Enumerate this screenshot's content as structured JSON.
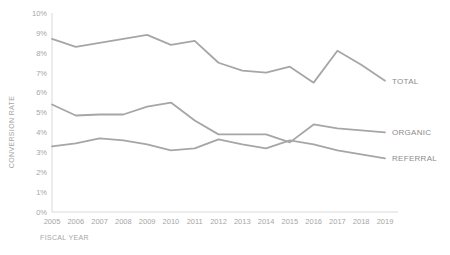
{
  "chart_data": {
    "type": "line",
    "title": "",
    "xlabel": "FISCAL YEAR",
    "ylabel": "CONVERSION RATE",
    "categories": [
      "2005",
      "2006",
      "2007",
      "2008",
      "2009",
      "2010",
      "2011",
      "2012",
      "2013",
      "2014",
      "2015",
      "2016",
      "2017",
      "2018",
      "2019"
    ],
    "x": [
      2005,
      2006,
      2007,
      2008,
      2009,
      2010,
      2011,
      2012,
      2013,
      2014,
      2015,
      2016,
      2017,
      2018,
      2019
    ],
    "ylim": [
      0,
      10
    ],
    "ytick_labels": [
      "0%",
      "1%",
      "2%",
      "3%",
      "4%",
      "5%",
      "6%",
      "7%",
      "8%",
      "9%",
      "10%"
    ],
    "ytick_values": [
      0,
      1,
      2,
      3,
      4,
      5,
      6,
      7,
      8,
      9,
      10
    ],
    "grid": false,
    "legend_position": "right-end-of-line",
    "series": [
      {
        "name": "TOTAL",
        "color": "#a6a6a6",
        "values": [
          8.7,
          8.3,
          8.5,
          8.7,
          8.9,
          8.4,
          8.6,
          7.5,
          7.1,
          7.0,
          7.3,
          6.5,
          8.1,
          7.4,
          6.6
        ]
      },
      {
        "name": "ORGANIC",
        "color": "#a6a6a6",
        "values": [
          5.4,
          4.85,
          4.9,
          4.9,
          5.3,
          5.5,
          4.6,
          3.9,
          3.9,
          3.9,
          3.5,
          4.4,
          4.2,
          4.1,
          4.0
        ]
      },
      {
        "name": "REFERRAL",
        "color": "#a6a6a6",
        "values": [
          3.3,
          3.45,
          3.7,
          3.6,
          3.4,
          3.1,
          3.2,
          3.65,
          3.4,
          3.2,
          3.6,
          3.4,
          3.1,
          2.9,
          2.7
        ]
      }
    ]
  },
  "colors": {
    "line": "#a6a6a6",
    "axis": "#d9d9d9",
    "text": "#a6a6a6",
    "label": "#8c8c8c",
    "background": "#ffffff"
  }
}
